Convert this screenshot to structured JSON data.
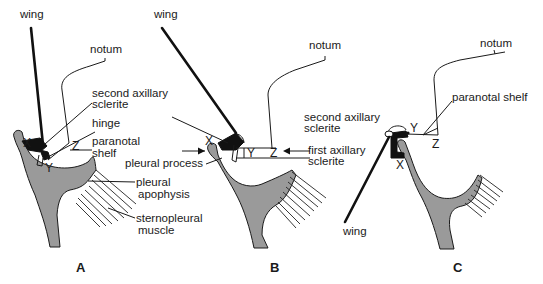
{
  "figure": {
    "panels": [
      {
        "id": "A",
        "label": "A",
        "labels": {
          "wing": "wing",
          "notum": "notum",
          "second_axillary_1": "second axillary",
          "second_axillary_2": "sclerite",
          "hinge": "hinge",
          "paranotal_1": "paranotal",
          "paranotal_2": "shelf",
          "pleural_apophysis_1": "pleural",
          "pleural_apophysis_2": "apophysis",
          "sternopleural_1": "sternopleural",
          "sternopleural_2": "muscle",
          "point_x": "X",
          "point_y": "Y",
          "point_z": "Z"
        }
      },
      {
        "id": "B",
        "label": "B",
        "labels": {
          "wing": "wing",
          "notum": "notum",
          "pleural_process": "pleural process",
          "second_axillary_1": "second axillary",
          "second_axillary_2": "sclerite",
          "first_axillary_1": "first axillary",
          "first_axillary_2": "sclerite",
          "point_x": "X",
          "point_y": "Y",
          "point_z": "Z"
        }
      },
      {
        "id": "C",
        "label": "C",
        "labels": {
          "wing": "wing",
          "notum": "notum",
          "paranotal": "paranotal shelf",
          "point_x": "X",
          "point_y": "Y",
          "point_z": "Z"
        }
      }
    ],
    "colors": {
      "pleuron_fill": "#9a9a9a",
      "sclerite": "#111111",
      "line": "#1a1a1a",
      "background": "#ffffff"
    }
  }
}
